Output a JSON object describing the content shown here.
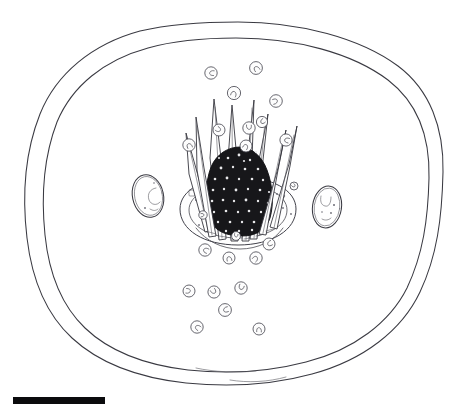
{
  "figure": {
    "domain_label": "scientific-line-drawing",
    "background_color": "#ffffff",
    "ink_color": "#3a3a42",
    "dark_mass_color": "#17171a",
    "width": 470,
    "height": 407,
    "title": "",
    "caption": "",
    "labels": []
  },
  "scale_bar": {
    "name": "scale-bar",
    "color": "#0b0b0d",
    "x": 13,
    "y": 397,
    "width": 92,
    "height": 7,
    "label": ""
  },
  "outer_wall": {
    "name": "outer-cell-wall",
    "description": "outer oval boundary",
    "stroke": "#3a3a42"
  },
  "inner_wall": {
    "name": "inner-cell-wall",
    "description": "inner oval boundary forming rim",
    "stroke": "#3a3a42"
  },
  "central_complex": {
    "name": "central-spined-apparatus",
    "base_disc": {
      "name": "basal-disc",
      "cx": 238,
      "cy": 211,
      "rx": 58,
      "ry": 34
    },
    "dark_mass": {
      "name": "dark-granular-mass",
      "cx": 240,
      "cy": 189,
      "rx": 30,
      "ry": 42,
      "color": "#17171a"
    },
    "spine_count": 8,
    "spines": [
      {
        "name": "spine-1",
        "tip_x": 196,
        "tip_y": 117,
        "base_x": 214,
        "base_y": 236
      },
      {
        "name": "spine-2",
        "tip_x": 214,
        "tip_y": 99,
        "base_x": 224,
        "base_y": 239
      },
      {
        "name": "spine-3",
        "tip_x": 232,
        "tip_y": 105,
        "base_x": 234,
        "base_y": 241
      },
      {
        "name": "spine-4",
        "tip_x": 254,
        "tip_y": 100,
        "base_x": 246,
        "base_y": 241
      },
      {
        "name": "spine-5",
        "tip_x": 268,
        "tip_y": 114,
        "base_x": 256,
        "base_y": 239
      },
      {
        "name": "spine-6",
        "tip_x": 286,
        "tip_y": 130,
        "base_x": 266,
        "base_y": 235
      },
      {
        "name": "spine-7",
        "tip_x": 297,
        "tip_y": 126,
        "base_x": 276,
        "base_y": 229
      },
      {
        "name": "spine-8",
        "tip_x": 186,
        "tip_y": 133,
        "base_x": 208,
        "base_y": 230
      }
    ]
  },
  "lateral_organelles": [
    {
      "name": "left-oval-organelle",
      "cx": 148,
      "cy": 196,
      "rx": 15,
      "ry": 21,
      "rotation": -12
    },
    {
      "name": "right-oval-organelle",
      "cx": 327,
      "cy": 207,
      "rx": 14,
      "ry": 21,
      "rotation": 8
    }
  ],
  "granules": [
    {
      "name": "granule",
      "cx": 211,
      "cy": 73,
      "r": 6.2
    },
    {
      "name": "granule",
      "cx": 256,
      "cy": 68,
      "r": 6.4
    },
    {
      "name": "granule",
      "cx": 234,
      "cy": 93,
      "r": 6.6
    },
    {
      "name": "granule",
      "cx": 276,
      "cy": 101,
      "r": 6.3
    },
    {
      "name": "granule",
      "cx": 219,
      "cy": 130,
      "r": 6.0
    },
    {
      "name": "granule",
      "cx": 249,
      "cy": 128,
      "r": 6.2
    },
    {
      "name": "granule",
      "cx": 262,
      "cy": 122,
      "r": 5.6
    },
    {
      "name": "granule",
      "cx": 286,
      "cy": 140,
      "r": 6.1
    },
    {
      "name": "granule",
      "cx": 189,
      "cy": 145,
      "r": 6.2
    },
    {
      "name": "granule",
      "cx": 246,
      "cy": 146,
      "r": 6.0
    },
    {
      "name": "granule",
      "cx": 203,
      "cy": 215,
      "r": 4.2
    },
    {
      "name": "granule",
      "cx": 294,
      "cy": 186,
      "r": 4.0
    },
    {
      "name": "granule",
      "cx": 236,
      "cy": 236,
      "r": 4.4
    },
    {
      "name": "granule",
      "cx": 269,
      "cy": 244,
      "r": 6.0
    },
    {
      "name": "granule",
      "cx": 205,
      "cy": 250,
      "r": 6.2
    },
    {
      "name": "granule",
      "cx": 229,
      "cy": 258,
      "r": 6.0
    },
    {
      "name": "granule",
      "cx": 256,
      "cy": 258,
      "r": 6.2
    },
    {
      "name": "granule",
      "cx": 189,
      "cy": 291,
      "r": 6.0
    },
    {
      "name": "granule",
      "cx": 214,
      "cy": 292,
      "r": 6.1
    },
    {
      "name": "granule",
      "cx": 241,
      "cy": 288,
      "r": 6.2
    },
    {
      "name": "granule",
      "cx": 225,
      "cy": 310,
      "r": 6.4
    },
    {
      "name": "granule",
      "cx": 197,
      "cy": 327,
      "r": 6.2
    },
    {
      "name": "granule",
      "cx": 259,
      "cy": 329,
      "r": 6.0
    }
  ]
}
